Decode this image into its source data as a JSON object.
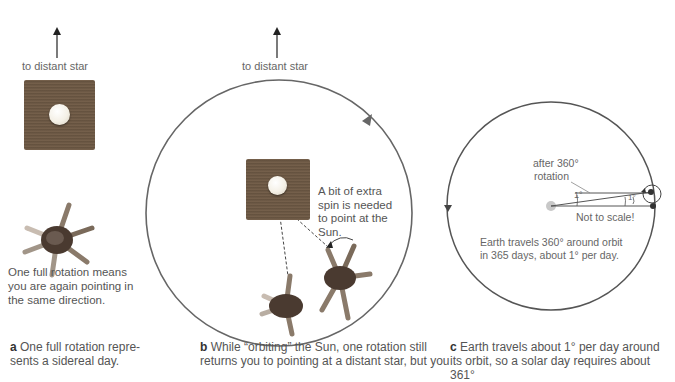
{
  "panel_a": {
    "arrow_label": "to distant star",
    "note": [
      "One full rotation means",
      "you are again pointing in",
      "the same direction."
    ],
    "caption_letter": "a",
    "caption_lines": [
      "One full rotation repre-",
      "sents a sidereal day."
    ]
  },
  "panel_b": {
    "arrow_label": "to distant star",
    "note": [
      "A bit of extra",
      "spin is needed",
      "to point at the",
      "Sun."
    ],
    "caption_letter": "b",
    "caption_lines": [
      "While “orbiting” the Sun, one rotation still",
      "returns you to pointing at a distant star, but you"
    ]
  },
  "panel_c": {
    "rotation_label": [
      "after 360°",
      "rotation"
    ],
    "angle_left": "1°",
    "angle_right": "1°",
    "scale_note": "Not to scale!",
    "orbit_note": [
      "Earth travels 360° around orbit",
      "in 365 days, about 1° per day."
    ],
    "caption_letter": "c",
    "caption_lines": [
      "Earth travels about 1° per day around",
      "its orbit, so a solar day requires about 361°"
    ]
  },
  "colors": {
    "line": "#555555",
    "text": "#555555",
    "wood": "#6e5a45"
  }
}
